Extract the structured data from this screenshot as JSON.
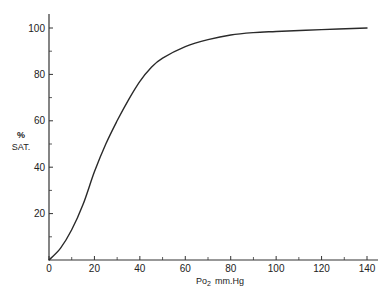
{
  "chart_data": {
    "type": "line",
    "title": "",
    "xlabel": "Po2 mm.Hg",
    "xlabel_main": "Po",
    "xlabel_sub": "2",
    "xlabel_unit": "mm.Hg",
    "ylabel_line1": "%",
    "ylabel_line2": "SAT.",
    "ylabel": "% SAT.",
    "xlim": [
      0,
      145
    ],
    "ylim": [
      0,
      105
    ],
    "x_ticks": [
      0,
      20,
      40,
      60,
      80,
      100,
      120,
      140
    ],
    "x_minor_ticks": [
      10,
      30,
      50,
      70,
      90,
      110,
      130
    ],
    "y_ticks": [
      20,
      40,
      60,
      80,
      100
    ],
    "y_minor_ticks": [
      10,
      30,
      50,
      70,
      90
    ],
    "x_origin_label": "0",
    "grid": false,
    "legend": null,
    "series": [
      {
        "name": "Oxygen saturation",
        "x": [
          0,
          5,
          10,
          15,
          20,
          25,
          30,
          35,
          40,
          45,
          50,
          60,
          70,
          80,
          90,
          100,
          120,
          140
        ],
        "values": [
          0,
          5,
          13,
          24,
          38,
          50,
          60,
          69,
          77,
          83,
          87,
          92,
          95,
          97,
          98,
          98.5,
          99.3,
          100
        ]
      }
    ]
  },
  "colors": {
    "line": "#2a2a2a",
    "axis": "#333333",
    "background": "#ffffff"
  }
}
